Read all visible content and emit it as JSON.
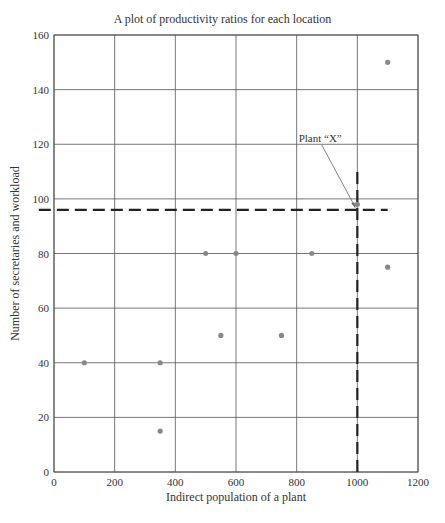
{
  "chart_data": {
    "type": "scatter",
    "title": "A plot of productivity ratios for each location",
    "xlabel": "Indirect population of a plant",
    "ylabel": "Number of secretaries and workload",
    "xlim": [
      0,
      1200
    ],
    "ylim": [
      0,
      160
    ],
    "xticks": [
      0,
      200,
      400,
      600,
      800,
      1000,
      1200
    ],
    "yticks": [
      0,
      20,
      40,
      60,
      80,
      100,
      120,
      140,
      160
    ],
    "grid": true,
    "legend": null,
    "series": [
      {
        "name": "Plants",
        "points": [
          {
            "x": 100,
            "y": 40
          },
          {
            "x": 350,
            "y": 40
          },
          {
            "x": 350,
            "y": 15
          },
          {
            "x": 500,
            "y": 80
          },
          {
            "x": 600,
            "y": 80
          },
          {
            "x": 850,
            "y": 80
          },
          {
            "x": 550,
            "y": 50
          },
          {
            "x": 750,
            "y": 50
          },
          {
            "x": 1100,
            "y": 150
          },
          {
            "x": 1100,
            "y": 75
          }
        ]
      }
    ],
    "annotations": [
      {
        "text": "Plant “X”",
        "point": {
          "x": 1000,
          "y": 98
        },
        "label_position": {
          "x": 800,
          "y": 122
        }
      }
    ],
    "reference_lines": [
      {
        "orientation": "horizontal",
        "y": 96,
        "x_from": -50,
        "x_to": 1100,
        "style": "dashed"
      },
      {
        "orientation": "vertical",
        "x": 1000,
        "y_from": 0,
        "y_to": 110,
        "style": "dashed"
      }
    ],
    "colors": {
      "point": "#888888",
      "grid": "#555555",
      "axis": "#555555",
      "reference_line": "#222222",
      "text": "#333333"
    }
  }
}
